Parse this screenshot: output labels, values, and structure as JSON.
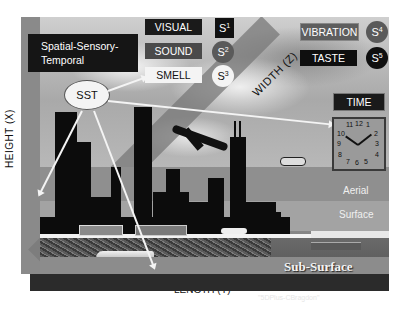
{
  "diagram": {
    "title": "Spatial-Sensory-Temporal",
    "center_node": "SST",
    "senses": [
      {
        "label": "VISUAL",
        "symbol": "S",
        "index": "1",
        "box_color": "#1a1a1a",
        "circle_color": "#111111"
      },
      {
        "label": "SOUND",
        "symbol": "S",
        "index": "2",
        "box_color": "#4a4a4a",
        "circle_color": "#5a5a5a"
      },
      {
        "label": "SMELL",
        "symbol": "S",
        "index": "3",
        "box_color": "#f4f4f4",
        "circle_color": "#f4f4f4"
      },
      {
        "label": "VIBRATION",
        "symbol": "S",
        "index": "4",
        "box_color": "#5e5e5e",
        "circle_color": "#5a5a5a"
      },
      {
        "label": "TASTE",
        "symbol": "S",
        "index": "5",
        "box_color": "#0f0f0f",
        "circle_color": "#0f0f0f"
      }
    ],
    "axes": {
      "height": "HEIGHT (X)",
      "width": "WIDTH (Z)",
      "length": "LENGTH (Y)"
    },
    "time": {
      "label": "TIME",
      "clock_numbers": [
        "11",
        "12",
        "1",
        "10",
        "2",
        "9",
        "3",
        "8",
        "4",
        "7",
        "6",
        "5"
      ]
    },
    "zones": {
      "aerial": "Aerial",
      "surface": "Surface",
      "sub_surface": "Sub-Surface"
    },
    "credit": "\"5DPlus-CBragdon\""
  }
}
